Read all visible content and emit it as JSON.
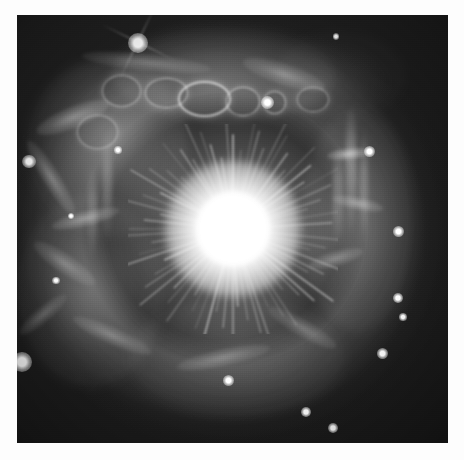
{
  "image": {
    "kind": "astronomical-photograph",
    "subject": "bright central star surrounded by a shell nebula",
    "palette": "grayscale",
    "alt_text": "Grayscale telescope image of an extremely bright star at centre with radial diffraction rays, encircled by a clumpy filamentary nebular shell containing bubble-like rings along its upper edge, set against a dark star field.",
    "border_color": "#fdfdfd",
    "sky_color": "#1d1d1d",
    "nebula_color": "#9a9a9a",
    "star_color": "#ffffff",
    "plate": {
      "left": 17,
      "top": 15,
      "width": 431,
      "height": 428
    }
  },
  "central_star": {
    "name": "central-star",
    "center_x_pct": 50,
    "center_y_pct": 50,
    "core_radius_px": 37,
    "halo_radius_px": 125,
    "ray_count": 72
  },
  "field_stars": [
    {
      "name": "bright-star-upper-left",
      "x_pct": 28.1,
      "y_pct": 6.5,
      "size": 9,
      "spikes": true
    },
    {
      "name": "star-above-rings",
      "x_pct": 58.2,
      "y_pct": 20.5,
      "size": 6,
      "spikes": false
    },
    {
      "name": "star-left-edge",
      "x_pct": 2.8,
      "y_pct": 34.3,
      "size": 6,
      "spikes": false
    },
    {
      "name": "star-right-upper",
      "x_pct": 81.9,
      "y_pct": 31.8,
      "size": 5,
      "spikes": false
    },
    {
      "name": "star-right-mid",
      "x_pct": 88.6,
      "y_pct": 50.5,
      "size": 5,
      "spikes": false
    },
    {
      "name": "star-right-lower",
      "x_pct": 88.4,
      "y_pct": 66.1,
      "size": 4.5,
      "spikes": false
    },
    {
      "name": "star-right-lower-two",
      "x_pct": 89.6,
      "y_pct": 70.6,
      "size": 3.5,
      "spikes": false
    },
    {
      "name": "star-lower-right",
      "x_pct": 84.7,
      "y_pct": 79.2,
      "size": 5,
      "spikes": false
    },
    {
      "name": "star-bottom-left-big",
      "x_pct": 1.2,
      "y_pct": 81.1,
      "size": 9,
      "spikes": false
    },
    {
      "name": "star-bottom-centre",
      "x_pct": 49.0,
      "y_pct": 85.3,
      "size": 5,
      "spikes": false
    },
    {
      "name": "star-bottom-right",
      "x_pct": 67.1,
      "y_pct": 92.8,
      "size": 4.5,
      "spikes": false
    },
    {
      "name": "star-bottom-far-right",
      "x_pct": 73.3,
      "y_pct": 96.5,
      "size": 4.5,
      "spikes": false
    },
    {
      "name": "star-nebula-left",
      "x_pct": 23.5,
      "y_pct": 31.5,
      "size": 3.5,
      "spikes": false
    },
    {
      "name": "star-left-lower",
      "x_pct": 9.0,
      "y_pct": 62.0,
      "size": 3.5,
      "spikes": false
    },
    {
      "name": "star-top-right-faint",
      "x_pct": 74.0,
      "y_pct": 5.0,
      "size": 3,
      "spikes": false
    },
    {
      "name": "star-mid-left-faint",
      "x_pct": 12.5,
      "y_pct": 47.0,
      "size": 3,
      "spikes": false
    }
  ],
  "nebula_bubbles": [
    {
      "name": "bubble-ring-one",
      "x_pct": 34.5,
      "y_pct": 18.0,
      "w": 9.5,
      "h": 6.5,
      "ring": 1.8,
      "opacity": 0.62
    },
    {
      "name": "bubble-ring-two",
      "x_pct": 43.0,
      "y_pct": 19.2,
      "w": 11.5,
      "h": 7.5,
      "ring": 2.0,
      "opacity": 0.72
    },
    {
      "name": "bubble-ring-three",
      "x_pct": 52.2,
      "y_pct": 20.0,
      "w": 7.5,
      "h": 6.2,
      "ring": 1.8,
      "opacity": 0.66
    },
    {
      "name": "bubble-ring-four",
      "x_pct": 59.5,
      "y_pct": 20.2,
      "w": 5.0,
      "h": 5.0,
      "ring": 1.6,
      "opacity": 0.55
    },
    {
      "name": "bubble-ring-five",
      "x_pct": 68.5,
      "y_pct": 19.5,
      "w": 7.0,
      "h": 5.5,
      "ring": 1.6,
      "opacity": 0.48
    },
    {
      "name": "bubble-ring-six",
      "x_pct": 24.0,
      "y_pct": 17.5,
      "w": 8.5,
      "h": 7.0,
      "ring": 1.7,
      "opacity": 0.5
    },
    {
      "name": "bubble-ring-seven",
      "x_pct": 18.5,
      "y_pct": 27.0,
      "w": 9.0,
      "h": 7.5,
      "ring": 1.6,
      "opacity": 0.45
    }
  ],
  "nebula_filaments": [
    {
      "name": "filament-upper-left-arc",
      "x_pct": 13.0,
      "y_pct": 24.0,
      "w": 18.0,
      "h": 5.0,
      "rot": -22,
      "opacity": 0.46
    },
    {
      "name": "filament-left-diagonal",
      "x_pct": 8.0,
      "y_pct": 38.0,
      "w": 20.0,
      "h": 4.0,
      "rot": 58,
      "opacity": 0.4
    },
    {
      "name": "filament-left-wisp",
      "x_pct": 16.0,
      "y_pct": 47.5,
      "w": 16.0,
      "h": 3.5,
      "rot": -14,
      "opacity": 0.44
    },
    {
      "name": "filament-left-lower-arc",
      "x_pct": 11.0,
      "y_pct": 58.0,
      "w": 17.0,
      "h": 4.5,
      "rot": 34,
      "opacity": 0.34
    },
    {
      "name": "filament-top-sweep",
      "x_pct": 30.0,
      "y_pct": 11.0,
      "w": 30.0,
      "h": 4.0,
      "rot": 6,
      "opacity": 0.34
    },
    {
      "name": "filament-topright-arc",
      "x_pct": 62.0,
      "y_pct": 14.0,
      "w": 20.0,
      "h": 5.0,
      "rot": 18,
      "opacity": 0.38
    },
    {
      "name": "filament-right-knot",
      "x_pct": 77.0,
      "y_pct": 32.5,
      "w": 10.0,
      "h": 2.8,
      "rot": -6,
      "opacity": 0.62
    },
    {
      "name": "filament-right-spur",
      "x_pct": 79.0,
      "y_pct": 44.0,
      "w": 12.0,
      "h": 3.0,
      "rot": 12,
      "opacity": 0.44
    },
    {
      "name": "filament-right-lower",
      "x_pct": 74.0,
      "y_pct": 57.0,
      "w": 13.0,
      "h": 3.5,
      "rot": -16,
      "opacity": 0.4
    },
    {
      "name": "filament-bottom-left",
      "x_pct": 22.0,
      "y_pct": 75.0,
      "w": 20.0,
      "h": 4.0,
      "rot": 24,
      "opacity": 0.34
    },
    {
      "name": "filament-bottom-centre",
      "x_pct": 48.0,
      "y_pct": 80.0,
      "w": 22.0,
      "h": 4.0,
      "rot": -12,
      "opacity": 0.36
    },
    {
      "name": "filament-bottom-right",
      "x_pct": 66.0,
      "y_pct": 73.0,
      "w": 18.0,
      "h": 4.0,
      "rot": 30,
      "opacity": 0.32
    },
    {
      "name": "filament-lower-left-edge",
      "x_pct": 6.0,
      "y_pct": 70.0,
      "w": 14.0,
      "h": 3.5,
      "rot": -40,
      "opacity": 0.3
    }
  ],
  "nebula_striations": [
    {
      "name": "striation-right-one",
      "x_pct": 77.5,
      "y_pct": 36.0,
      "w": 2.2,
      "h": 30.0,
      "opacity": 0.3
    },
    {
      "name": "striation-right-two",
      "x_pct": 80.5,
      "y_pct": 40.0,
      "w": 1.8,
      "h": 26.0,
      "opacity": 0.24
    },
    {
      "name": "striation-right-three",
      "x_pct": 74.5,
      "y_pct": 42.0,
      "w": 2.4,
      "h": 24.0,
      "opacity": 0.26
    },
    {
      "name": "striation-left-one",
      "x_pct": 21.0,
      "y_pct": 40.0,
      "w": 2.2,
      "h": 26.0,
      "opacity": 0.22
    },
    {
      "name": "striation-left-two",
      "x_pct": 17.5,
      "y_pct": 46.0,
      "w": 2.0,
      "h": 22.0,
      "opacity": 0.2
    }
  ]
}
